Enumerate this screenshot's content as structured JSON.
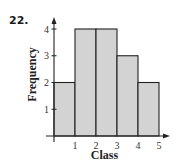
{
  "problem_number": "22.",
  "chart_data": {
    "type": "bar",
    "subtype": "histogram",
    "title": "",
    "xlabel": "Class",
    "ylabel": "Frequency",
    "bins": [
      [
        0,
        1
      ],
      [
        1,
        2
      ],
      [
        2,
        3
      ],
      [
        3,
        4
      ],
      [
        4,
        5
      ]
    ],
    "categories": [
      "0-1",
      "1-2",
      "2-3",
      "3-4",
      "4-5"
    ],
    "values": [
      2,
      4,
      4,
      3,
      2
    ],
    "x_ticks": [
      "1",
      "2",
      "3",
      "4",
      "5"
    ],
    "y_ticks": [
      "1",
      "2",
      "3",
      "4"
    ],
    "xlim": [
      0,
      5
    ],
    "ylim": [
      0,
      4
    ],
    "grid": false,
    "legend": null,
    "bar_color": "#d3d3d3",
    "edge_color": "#222222"
  }
}
